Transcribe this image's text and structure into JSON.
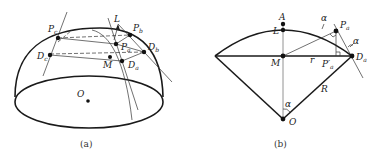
{
  "panel_a": {
    "caption": "(a)",
    "labels": {
      "Pc": {
        "main": "P",
        "sub": "c"
      },
      "Dc": {
        "main": "D",
        "sub": "c"
      },
      "L": {
        "main": "L",
        "sub": ""
      },
      "Pb": {
        "main": "P",
        "sub": "b"
      },
      "Pa": {
        "main": "P",
        "sub": "a"
      },
      "Db": {
        "main": "D",
        "sub": "b"
      },
      "M": {
        "main": "M",
        "sub": ""
      },
      "Da": {
        "main": "D",
        "sub": "a"
      },
      "O": {
        "main": "O",
        "sub": ""
      }
    }
  },
  "panel_b": {
    "caption": "(b)",
    "labels": {
      "A": "A",
      "L": "L",
      "M": "M",
      "r": "r",
      "R": "R",
      "O": "O",
      "alpha_top": "α",
      "alpha_right": "α",
      "alpha_bottom": "α",
      "Pa": {
        "main": "P",
        "sub": "a"
      },
      "Pa_prime": {
        "main": "P′",
        "sub": "a"
      },
      "Da": {
        "main": "D",
        "sub": "a"
      }
    }
  }
}
